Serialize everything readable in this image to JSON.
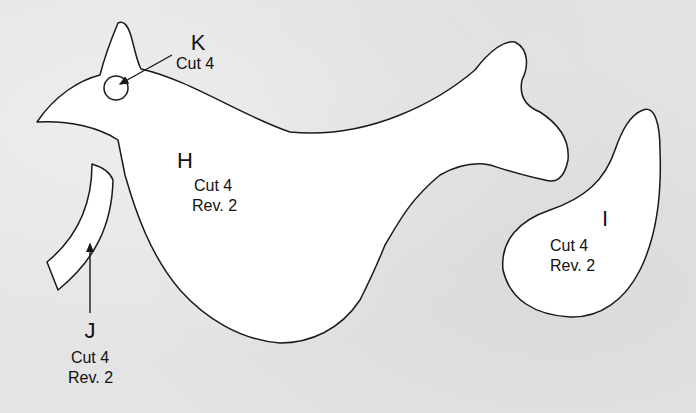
{
  "colors": {
    "background": "#e4e4e4",
    "piece_fill": "#ffffff",
    "outline": "#1a1a1a",
    "text": "#111111"
  },
  "pieces": {
    "H": {
      "letter": "H",
      "cut": "Cut 4",
      "rev": "Rev. 2",
      "shape": "bird body"
    },
    "I": {
      "letter": "I",
      "cut": "Cut 4",
      "rev": "Rev. 2",
      "shape": "wing / teardrop"
    },
    "J": {
      "letter": "J",
      "cut": "Cut 4",
      "rev": "Rev. 2",
      "shape": "curved strip"
    },
    "K": {
      "letter": "K",
      "cut": "Cut 4",
      "shape": "eye circle"
    }
  }
}
